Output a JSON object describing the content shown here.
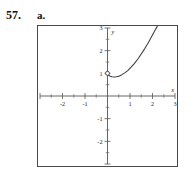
{
  "exercise": {
    "number": "57.",
    "part": "a."
  },
  "chart_data": {
    "type": "line",
    "title": "",
    "xlabel": "x",
    "ylabel": "y",
    "xlim": [
      -3,
      3
    ],
    "ylim": [
      -3,
      3
    ],
    "grid": false,
    "legend": false,
    "x_ticks": [
      -3,
      -2,
      -1,
      0,
      1,
      2,
      3
    ],
    "x_tick_labels": [
      "",
      "-2",
      "-1",
      "",
      "1",
      "2",
      "3"
    ],
    "y_ticks": [
      -3,
      -2,
      -1,
      0,
      1,
      2,
      3
    ],
    "y_tick_labels": [
      "",
      "-2",
      "-1",
      "",
      "1",
      "2",
      "3"
    ],
    "minor_tick_step": 0.5,
    "series": [
      {
        "name": "curve",
        "x": [
          -0.02,
          0.05,
          0.12,
          0.2,
          0.3,
          0.4,
          0.5,
          0.62,
          0.75,
          0.9,
          1.05,
          1.2,
          1.35,
          1.5,
          1.65,
          1.8,
          1.95,
          2.1,
          2.2,
          2.3
        ],
        "y": [
          1.0,
          0.92,
          0.87,
          0.845,
          0.835,
          0.845,
          0.875,
          0.93,
          1.01,
          1.12,
          1.27,
          1.44,
          1.63,
          1.85,
          2.08,
          2.33,
          2.6,
          2.88,
          3.05,
          3.25
        ]
      }
    ],
    "annotations": [
      {
        "kind": "open-circle",
        "x": 0,
        "y": 1,
        "label": ""
      }
    ]
  }
}
